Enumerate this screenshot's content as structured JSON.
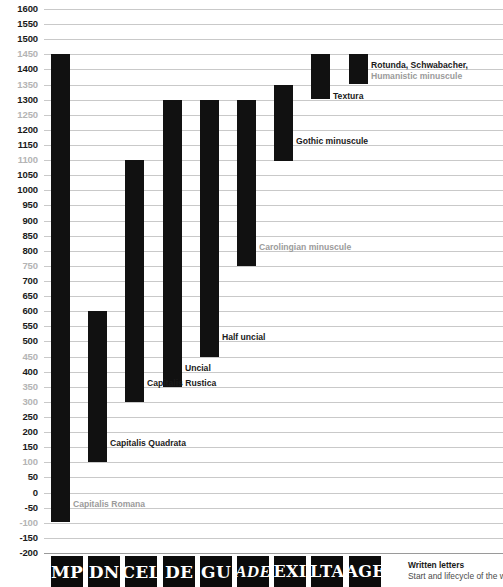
{
  "chart_data": {
    "type": "bar",
    "orientation": "vertical-range",
    "title": "Written letters",
    "subtitle": "Start and lifecycle of the written",
    "xlabel": "",
    "ylabel": "",
    "ylim": [
      -200,
      1600
    ],
    "ytick_step": 50,
    "grid": true,
    "legend": "none",
    "yticks": [
      {
        "value": 1600,
        "label": "1600",
        "muted": false
      },
      {
        "value": 1550,
        "label": "1550",
        "muted": false
      },
      {
        "value": 1500,
        "label": "1500",
        "muted": false
      },
      {
        "value": 1450,
        "label": "1450",
        "muted": true
      },
      {
        "value": 1400,
        "label": "1400",
        "muted": false
      },
      {
        "value": 1350,
        "label": "1350",
        "muted": true
      },
      {
        "value": 1300,
        "label": "1300",
        "muted": false
      },
      {
        "value": 1250,
        "label": "1250",
        "muted": true
      },
      {
        "value": 1200,
        "label": "1200",
        "muted": false
      },
      {
        "value": 1150,
        "label": "1150",
        "muted": false
      },
      {
        "value": 1100,
        "label": "1100",
        "muted": true
      },
      {
        "value": 1050,
        "label": "1050",
        "muted": false
      },
      {
        "value": 1000,
        "label": "1000",
        "muted": false
      },
      {
        "value": 950,
        "label": "950",
        "muted": false
      },
      {
        "value": 900,
        "label": "900",
        "muted": false
      },
      {
        "value": 850,
        "label": "850",
        "muted": false
      },
      {
        "value": 800,
        "label": "800",
        "muted": false
      },
      {
        "value": 750,
        "label": "750",
        "muted": true
      },
      {
        "value": 700,
        "label": "700",
        "muted": false
      },
      {
        "value": 650,
        "label": "650",
        "muted": false
      },
      {
        "value": 600,
        "label": "600",
        "muted": false
      },
      {
        "value": 550,
        "label": "550",
        "muted": false
      },
      {
        "value": 500,
        "label": "500",
        "muted": false
      },
      {
        "value": 450,
        "label": "450",
        "muted": true
      },
      {
        "value": 400,
        "label": "400",
        "muted": false
      },
      {
        "value": 350,
        "label": "350",
        "muted": true
      },
      {
        "value": 300,
        "label": "300",
        "muted": true
      },
      {
        "value": 250,
        "label": "250",
        "muted": false
      },
      {
        "value": 200,
        "label": "200",
        "muted": false
      },
      {
        "value": 150,
        "label": "150",
        "muted": false
      },
      {
        "value": 100,
        "label": "100",
        "muted": true
      },
      {
        "value": 50,
        "label": "50",
        "muted": false
      },
      {
        "value": 0,
        "label": "0",
        "muted": false
      },
      {
        "value": -50,
        "label": "-50",
        "muted": false
      },
      {
        "value": -100,
        "label": "-100",
        "muted": true
      },
      {
        "value": -150,
        "label": "-150",
        "muted": false
      },
      {
        "value": -200,
        "label": "-200",
        "muted": false
      }
    ],
    "series": [
      {
        "name": "Capitalis Romana",
        "label": "Capitalis Romana",
        "label_muted": true,
        "start": -100,
        "end": 1450,
        "label_at": -50,
        "specimen": "MP"
      },
      {
        "name": "Capitalis Quadrata",
        "label": "Capitalis Quadrata",
        "label_muted": false,
        "start": 100,
        "end": 600,
        "label_at": 150,
        "specimen": "DN"
      },
      {
        "name": "Capitalis Rustica",
        "label": "Capitalis Rustica",
        "label_muted": false,
        "start": 300,
        "end": 1100,
        "label_at": 350,
        "specimen": "CEL"
      },
      {
        "name": "Uncial",
        "label": "Uncial",
        "label_muted": false,
        "start": 350,
        "end": 1300,
        "label_at": 400,
        "specimen": "DE"
      },
      {
        "name": "Half uncial",
        "label": "Half uncial",
        "label_muted": false,
        "start": 450,
        "end": 1300,
        "label_at": 500,
        "specimen": "GU"
      },
      {
        "name": "Carolingian minuscule",
        "label": "Carolingian minuscule",
        "label_muted": true,
        "start": 750,
        "end": 1300,
        "label_at": 800,
        "specimen": "ADE"
      },
      {
        "name": "Gothic minuscule",
        "label": "Gothic minuscule",
        "label_muted": false,
        "start": 1100,
        "end": 1350,
        "label_at": 1150,
        "specimen": "EXI"
      },
      {
        "name": "Textura",
        "label": "Textura",
        "label_muted": false,
        "start": 1300,
        "end": 1450,
        "label_at": 1300,
        "specimen": "LTA"
      },
      {
        "name": "Rotunda, Schwabacher, Humanistic minuscule",
        "label": "Rotunda, Schwabacher,",
        "label_line2": "Humanistic minuscule",
        "label_muted": false,
        "label_line2_muted": true,
        "start": 1350,
        "end": 1450,
        "label_at": 1400,
        "specimen": "AGE"
      }
    ]
  },
  "axis": {
    "min_label": "-200",
    "max_label": "1600"
  },
  "footer": {
    "title": "Written letters",
    "subtitle": "Start and lifecycle of the written"
  },
  "colors": {
    "bar": "#111111",
    "grid": "#c9c9c9",
    "tick": "#1a1a1a",
    "tick_muted": "#b4b4b4",
    "label_muted": "#9b9b9b",
    "specimen_bg": "#0b0b0b",
    "specimen_fg": "#ffffff",
    "background": "#ffffff"
  }
}
